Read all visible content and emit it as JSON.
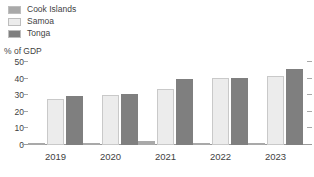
{
  "legend": {
    "position": "top-left",
    "items": [
      {
        "label": "Cook Islands",
        "color": "#a9a9a9"
      },
      {
        "label": "Samoa",
        "color": "#ececec"
      },
      {
        "label": "Tonga",
        "color": "#7f7f7f"
      }
    ]
  },
  "axis_title": "% of GDP",
  "chart_data": {
    "type": "bar",
    "title": "",
    "subtitle": "",
    "xlabel": "",
    "ylabel": "% of GDP",
    "categories": [
      "2019",
      "2020",
      "2021",
      "2022",
      "2023"
    ],
    "series": [
      {
        "name": "Cook Islands",
        "color": "#a9a9a9",
        "values": [
          0.5,
          1.0,
          2.5,
          0.3,
          0.3
        ]
      },
      {
        "name": "Samoa",
        "color": "#ececec",
        "values": [
          28.0,
          30.0,
          34.0,
          40.5,
          41.5
        ]
      },
      {
        "name": "Tonga",
        "color": "#7f7f7f",
        "values": [
          29.5,
          30.5,
          39.5,
          40.5,
          46.0
        ]
      }
    ],
    "ylim": [
      0,
      50
    ],
    "yticks": [
      0,
      10,
      20,
      30,
      40,
      50
    ],
    "ytick_labels": [
      "0",
      "10",
      "20",
      "30",
      "40",
      "50"
    ],
    "grid": false,
    "legend_position": "top-left"
  }
}
